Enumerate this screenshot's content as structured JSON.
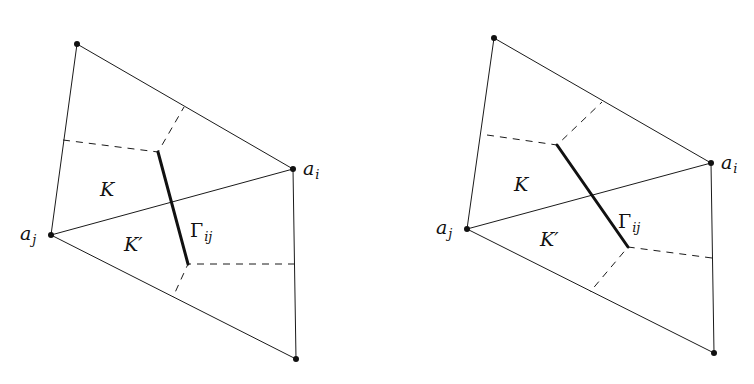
{
  "diagrams": [
    {
      "name": "left",
      "vertices": {
        "top": [
          77,
          44
        ],
        "a_i": [
          293,
          169
        ],
        "a_j": [
          51,
          235
        ],
        "bottom": [
          296,
          359
        ]
      },
      "dashed_upper": [
        [
          63,
          140
        ],
        [
          158,
          152
        ],
        [
          184,
          107
        ]
      ],
      "dashed_lower": [
        [
          295,
          264
        ],
        [
          188,
          264
        ],
        [
          173,
          297
        ]
      ],
      "gamma_segment": [
        [
          158,
          152
        ],
        [
          188,
          264
        ]
      ],
      "labels": {
        "a_i": {
          "main": "a",
          "sub": "i",
          "pos": [
            303,
            175
          ]
        },
        "a_j": {
          "main": "a",
          "sub": "j",
          "pos": [
            20,
            240
          ]
        },
        "K": {
          "text": "K",
          "pos": [
            100,
            196
          ]
        },
        "K_prime": {
          "text": "K′",
          "pos": [
            124,
            251
          ]
        },
        "Gamma": {
          "main": "Γ",
          "sub": "ij",
          "pos": [
            190,
            237
          ]
        }
      }
    },
    {
      "name": "right",
      "vertices": {
        "top": [
          494,
          38
        ],
        "a_i": [
          711,
          163
        ],
        "a_j": [
          467,
          229
        ],
        "bottom": [
          714,
          353
        ]
      },
      "dashed_upper": [
        [
          487,
          135
        ],
        [
          557,
          145
        ],
        [
          602,
          102
        ]
      ],
      "dashed_lower": [
        [
          712,
          258
        ],
        [
          628,
          247
        ],
        [
          590,
          292
        ]
      ],
      "gamma_segment": [
        [
          557,
          145
        ],
        [
          628,
          247
        ]
      ],
      "labels": {
        "a_i": {
          "main": "a",
          "sub": "i",
          "pos": [
            721,
            169
          ]
        },
        "a_j": {
          "main": "a",
          "sub": "j",
          "pos": [
            436,
            234
          ]
        },
        "K": {
          "text": "K",
          "pos": [
            514,
            191
          ]
        },
        "K_prime": {
          "text": "K′",
          "pos": [
            540,
            246
          ]
        },
        "Gamma": {
          "main": "Γ",
          "sub": "ij",
          "pos": [
            618,
            228
          ]
        }
      }
    }
  ]
}
